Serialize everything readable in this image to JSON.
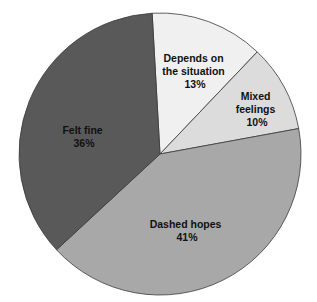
{
  "chart_data": {
    "type": "pie",
    "title": "",
    "categories": [
      "Depends on the situation",
      "Mixed feelings",
      "Dashed hopes",
      "Felt fine"
    ],
    "values": [
      13,
      10,
      41,
      36
    ],
    "unit": "%",
    "start_angle_deg": -3.2,
    "direction": "clockwise",
    "legend": "none (labels inside slices)",
    "slices": [
      {
        "label_lines": [
          "Depends on",
          "the situation"
        ],
        "pct": "13%",
        "value": 13,
        "color": "#f0f0f0"
      },
      {
        "label_lines": [
          "Mixed",
          "feelings"
        ],
        "pct": "10%",
        "value": 10,
        "color": "#dcdcdc"
      },
      {
        "label_lines": [
          "Dashed hopes"
        ],
        "pct": "41%",
        "value": 41,
        "color": "#a8a8a8"
      },
      {
        "label_lines": [
          "Felt fine"
        ],
        "pct": "36%",
        "value": 36,
        "color": "#595959"
      }
    ]
  },
  "labels": {
    "depends_l1": "Depends on",
    "depends_l2": "the situation",
    "depends_pct": "13%",
    "mixed_l1": "Mixed",
    "mixed_l2": "feelings",
    "mixed_pct": "10%",
    "dashed_l1": "Dashed hopes",
    "dashed_pct": "41%",
    "felt_l1": "Felt fine",
    "felt_pct": "36%"
  }
}
